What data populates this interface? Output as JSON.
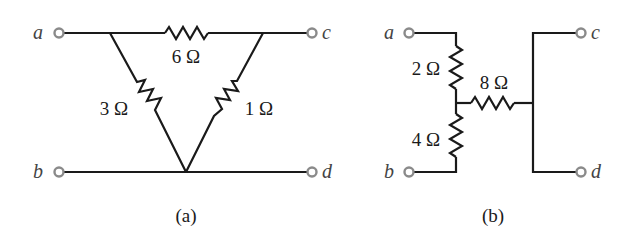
{
  "figure_a": {
    "caption": "(a)",
    "topology": "delta",
    "terminals": {
      "a": "a",
      "b": "b",
      "c": "c",
      "d": "d"
    },
    "resistors": [
      {
        "id": "R_top",
        "label": "6 Ω",
        "value_ohms": 6,
        "between": [
          "a-c junctions"
        ]
      },
      {
        "id": "R_left",
        "label": "3 Ω",
        "value_ohms": 3,
        "between": [
          "top-left junction",
          "bottom apex"
        ]
      },
      {
        "id": "R_right",
        "label": "1 Ω",
        "value_ohms": 1,
        "between": [
          "top-right junction",
          "bottom apex"
        ]
      }
    ]
  },
  "figure_b": {
    "caption": "(b)",
    "topology": "wye",
    "terminals": {
      "a": "a",
      "b": "b",
      "c": "c",
      "d": "d"
    },
    "resistors": [
      {
        "id": "R_upper",
        "label": "2 Ω",
        "value_ohms": 2,
        "between": [
          "a",
          "center node"
        ]
      },
      {
        "id": "R_lower",
        "label": "4 Ω",
        "value_ohms": 4,
        "between": [
          "center node",
          "b"
        ]
      },
      {
        "id": "R_mid",
        "label": "8 Ω",
        "value_ohms": 8,
        "between": [
          "center node",
          "c-d bus"
        ]
      }
    ]
  },
  "colors": {
    "wire": "#1a1a1a",
    "terminal": "#8a8a8a",
    "terminal_label": "#444444",
    "background": "#ffffff"
  }
}
